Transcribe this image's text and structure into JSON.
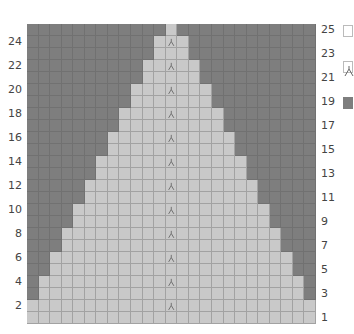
{
  "chart": {
    "rows": 25,
    "columns": 25,
    "colors": {
      "background_stitch": "#7e7e7e",
      "main_stitch": "#c9c9c9",
      "grid_line": "#8a8a8a"
    },
    "shape_rule": "rows 2k+1 and 2k+2 (k=0..12) use columns k+1..25-k as main color",
    "symbol": {
      "name": "decrease-stitch",
      "column": 13,
      "rows": [
        2,
        4,
        6,
        8,
        10,
        12,
        14,
        16,
        18,
        20,
        22,
        24
      ]
    },
    "left_row_labels": [
      "24",
      "22",
      "20",
      "18",
      "16",
      "14",
      "12",
      "10",
      "8",
      "6",
      "4",
      "2"
    ],
    "right_row_labels": [
      "25",
      "23",
      "21",
      "19",
      "17",
      "15",
      "13",
      "11",
      "9",
      "7",
      "5",
      "3",
      "1"
    ]
  },
  "legend": [
    {
      "name": "knit-stitch-key",
      "fill": "#ffffff"
    },
    {
      "name": "decrease-stitch-key",
      "fill": "#ffffff"
    },
    {
      "name": "dark-color-key",
      "fill": "#7e7e7e"
    }
  ]
}
